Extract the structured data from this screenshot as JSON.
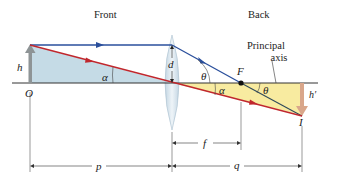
{
  "headings": {
    "front": "Front",
    "back": "Back"
  },
  "labels": {
    "object_height": "h",
    "object_point": "O",
    "lens_half_height": "d",
    "angle_alpha_object": "α",
    "angle_alpha_image": "α",
    "angle_theta_lens": "θ",
    "angle_theta_focus": "θ",
    "focal_point": "F",
    "principal_axis_line1": "Principal",
    "principal_axis_line2": "axis",
    "image_height": "h′",
    "image_point": "I",
    "focal_length": "f",
    "object_distance": "p",
    "image_distance": "q"
  },
  "colors": {
    "parallel_ray": "#2a4f9c",
    "central_ray": "#c0272d",
    "focal_ray_after": "#2f4a5a",
    "object_triangle": "#c5dbe6",
    "image_triangle": "#f8eba0",
    "object_arrow": "#8e9496",
    "image_arrow": "#d9a68a",
    "lens_fill": "#d7e4ee",
    "axis": "#333333"
  }
}
